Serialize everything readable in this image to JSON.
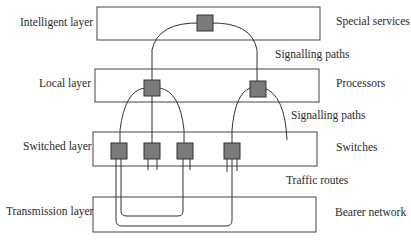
{
  "diagram": {
    "layers": [
      {
        "id": "intelligent",
        "label": "Intelligent layer",
        "right_label": "Special services"
      },
      {
        "id": "local",
        "label": "Local layer",
        "right_label": "Processors"
      },
      {
        "id": "switched",
        "label": "Switched layer",
        "right_label": "Switches"
      },
      {
        "id": "transmission",
        "label": "Transmission layer",
        "right_label": "Bearer network"
      }
    ],
    "between_labels": {
      "intelligent_local": "Signalling paths",
      "local_switched": "Signalling paths",
      "switched_transmission": "Traffic routes"
    },
    "colors": {
      "node_fill": "#7a7a7a",
      "line": "#333333",
      "box_border": "#444444"
    }
  }
}
